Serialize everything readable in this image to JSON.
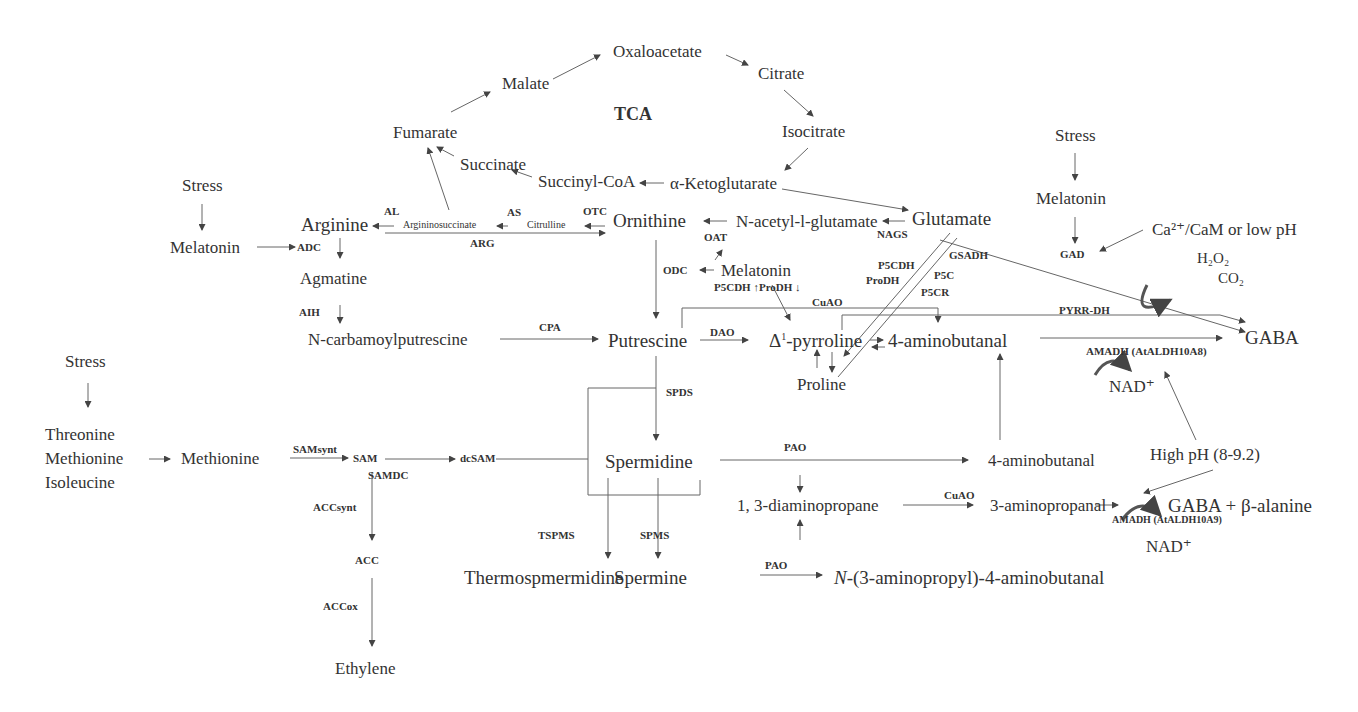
{
  "diagram": {
    "title": "TCA",
    "tca": {
      "oxaloacetate": "Oxaloacetate",
      "citrate": "Citrate",
      "isocitrate": "Isocitrate",
      "alpha_ketoglutarate": "α-Ketoglutarate",
      "succinyl_coa": "Succinyl-CoA",
      "succinate": "Succinate",
      "fumarate": "Fumarate",
      "malate": "Malate"
    },
    "nodes": {
      "stress_1": "Stress",
      "melatonin_1": "Melatonin",
      "arginine": "Arginine",
      "argininosuccinate": "Argininosuccinate",
      "citrulline": "Citrulline",
      "ornithine": "Ornithine",
      "n_acetyl_glutamate": "N-acetyl-l-glutamate",
      "glutamate": "Glutamate",
      "agmatine": "Agmatine",
      "n_carbamoylputrescine": "N-carbamoylputrescine",
      "putrescine": "Putrescine",
      "melatonin_2": "Melatonin",
      "pyrroline_prefix": "Δ",
      "pyrroline_sup": "1",
      "pyrroline_suffix": "-pyrroline",
      "aminobutanal_1": "4-aminobutanal",
      "proline": "Proline",
      "stress_3": "Stress",
      "melatonin_3": "Melatonin",
      "ca_cam": "Ca²⁺/CaM or low pH",
      "h2o2": "H₂O₂",
      "co2": "CO₂",
      "gaba": "GABA",
      "nad_1": "NAD⁺",
      "stress_2": "Stress",
      "threonine": "Threonine",
      "methionine_1": "Methionine",
      "isoleucine": "Isoleucine",
      "methionine_2": "Methionine",
      "sam": "SAM",
      "dcsam": "dcSAM",
      "spermidine": "Spermidine",
      "aminobutanal_2": "4-aminobutanal",
      "high_ph": "High pH (8-9.2)",
      "diaminopropane": "1, 3-diaminopropane",
      "aminopropanal": "3-aminopropanal",
      "gaba_beta_alanine": "GABA + β-alanine",
      "nad_2": "NAD⁺",
      "acc": "ACC",
      "thermospermidine": "Thermospmermidine",
      "spermine": "Spermine",
      "aminopropyl_n": "N",
      "aminopropyl_rest": "-(3-aminopropyl)-4-aminobutanal",
      "ethylene": "Ethylene"
    },
    "enzymes": {
      "al": "AL",
      "as": "AS",
      "otc": "OTC",
      "arg": "ARG",
      "adc": "ADC",
      "aih": "AIH",
      "cpa": "CPA",
      "oat": "OAT",
      "nags": "NAGS",
      "odc": "ODC",
      "p5cdh_prodh": "P5CDH ↑ProDH ↓",
      "cuao_1": "CuAO",
      "dao": "DAO",
      "p5cdh": "P5CDH",
      "prodh": "ProDH",
      "gsadh": "GSADH",
      "p5c": "P5C",
      "p5cr": "P5CR",
      "gad": "GAD",
      "pyrr_dh": "PYRR-DH",
      "amadh_1": "AMADH (AtALDH10A8)",
      "spds": "SPDS",
      "samsynt": "SAMsynt",
      "samdc": "SAMDC",
      "pao_1": "PAO",
      "cuao_2": "CuAO",
      "amadh_2": "AMADH (AtALDH10A9)",
      "accsynt": "ACCsynt",
      "tspms": "TSPMS",
      "spms": "SPMS",
      "pao_2": "PAO",
      "accox": "ACCox"
    }
  }
}
